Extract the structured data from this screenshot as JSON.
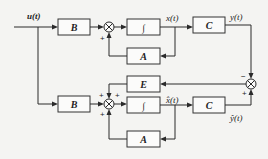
{
  "diagram": {
    "type": "block-diagram",
    "input": {
      "label": "u(t)"
    },
    "plant": {
      "blocks": [
        {
          "id": "B_top",
          "label": "B"
        },
        {
          "id": "int_top",
          "label": "∫"
        },
        {
          "id": "C_top",
          "label": "C"
        },
        {
          "id": "A_top",
          "label": "A"
        }
      ],
      "signals": {
        "state": "x(t)",
        "output": "y(t)"
      },
      "summer_signs": {
        "feedback": "+"
      }
    },
    "error": {
      "block": {
        "id": "E",
        "label": "E"
      },
      "summer_signs": {
        "top": "−",
        "bottom": "+"
      }
    },
    "observer": {
      "blocks": [
        {
          "id": "B_bottom",
          "label": "B"
        },
        {
          "id": "int_bottom",
          "label": "∫"
        },
        {
          "id": "C_bottom",
          "label": "C"
        },
        {
          "id": "A_bottom",
          "label": "A"
        }
      ],
      "signals": {
        "state": "x̂(t)",
        "output": "ŷ(t)"
      },
      "summer_signs": {
        "from_E": "+",
        "from_B": "+",
        "from_A": "+"
      }
    }
  }
}
